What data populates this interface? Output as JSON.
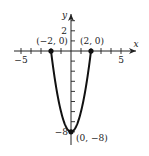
{
  "chart_data": {
    "type": "line",
    "title": "",
    "function": "y = 2x^2 - 8",
    "xlabel": "x",
    "ylabel": "y",
    "xlim": [
      -5.5,
      5.5
    ],
    "ylim": [
      -8.5,
      3.5
    ],
    "x_ticks": [
      -5,
      -4,
      -3,
      -2,
      -1,
      1,
      2,
      3,
      4,
      5
    ],
    "y_ticks": [
      -8,
      -7,
      -6,
      -5,
      -4,
      -3,
      -2,
      -1,
      1,
      2,
      3
    ],
    "x_tick_labels": [
      {
        "value": -5,
        "text": "−5"
      },
      {
        "value": 5,
        "text": "5"
      }
    ],
    "y_tick_labels": [
      {
        "value": 2,
        "text": "2"
      },
      {
        "value": -8,
        "text": "−8"
      }
    ],
    "grid": false,
    "series": [
      {
        "name": "parabola",
        "x": [
          -2.0,
          -1.5,
          -1.0,
          -0.5,
          0.0,
          0.5,
          1.0,
          1.5,
          2.0
        ],
        "y": [
          0.0,
          -3.5,
          -6.0,
          -7.5,
          -8.0,
          -7.5,
          -6.0,
          -3.5,
          0.0
        ]
      }
    ],
    "annotations": [
      {
        "point": [
          -2,
          0
        ],
        "text": "(−2, 0)"
      },
      {
        "point": [
          2,
          0
        ],
        "text": "(2, 0)"
      },
      {
        "point": [
          0,
          -8
        ],
        "text": "(0, −8)"
      }
    ]
  }
}
